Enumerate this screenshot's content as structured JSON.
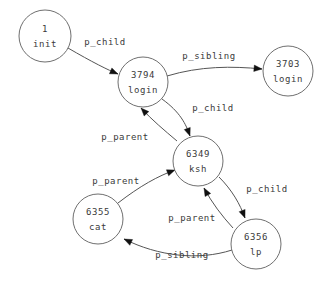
{
  "diagram": {
    "type": "directed-graph",
    "background_color": "#ffffff",
    "node_stroke_color": "#6f6f6f",
    "edge_stroke_color": "#555555",
    "text_color": "#3a3a3a",
    "nodes": [
      {
        "id": "init",
        "pid": "1",
        "name": "init",
        "cx": 45,
        "cy": 36,
        "r": 26
      },
      {
        "id": "login1",
        "pid": "3794",
        "name": "login",
        "cx": 143,
        "cy": 82,
        "r": 25
      },
      {
        "id": "login2",
        "pid": "3703",
        "name": "login",
        "cx": 288,
        "cy": 71,
        "r": 25
      },
      {
        "id": "ksh",
        "pid": "6349",
        "name": "ksh",
        "cx": 198,
        "cy": 161,
        "r": 25
      },
      {
        "id": "cat",
        "pid": "6355",
        "name": "cat",
        "cx": 98,
        "cy": 219,
        "r": 25
      },
      {
        "id": "lp",
        "pid": "6356",
        "name": "lp",
        "cx": 256,
        "cy": 244,
        "r": 25
      }
    ],
    "edges": [
      {
        "id": "e1",
        "from": "init",
        "to": "login1",
        "label": "p_child",
        "label_x": 105,
        "label_y": 42,
        "path": "M 68,48 C 92,62 108,70 118,74"
      },
      {
        "id": "e2",
        "from": "login1",
        "to": "login2",
        "label": "p_sibling",
        "label_x": 209,
        "label_y": 56,
        "path": "M 167,76 C 200,66 232,66 262,69"
      },
      {
        "id": "e3",
        "from": "login1",
        "to": "ksh",
        "label": "p_child",
        "label_x": 213,
        "label_y": 108,
        "path": "M 162,99 C 180,112 186,124 190,136"
      },
      {
        "id": "e4",
        "from": "ksh",
        "to": "login1",
        "label": "p_parent",
        "label_x": 125,
        "label_y": 137,
        "path": "M 177,141 C 164,130 152,120 141,108"
      },
      {
        "id": "e5",
        "from": "cat",
        "to": "ksh",
        "label": "p_parent",
        "label_x": 116,
        "label_y": 181,
        "path": "M 118,203 C 140,186 158,176 175,170"
      },
      {
        "id": "e6",
        "from": "ksh",
        "to": "lp",
        "label": "p_child",
        "label_x": 267,
        "label_y": 189,
        "path": "M 219,177 C 232,190 240,204 245,218"
      },
      {
        "id": "e7",
        "from": "lp",
        "to": "ksh",
        "label": "p_parent",
        "label_x": 192,
        "label_y": 218,
        "path": "M 233,228 C 222,216 212,203 204,188"
      },
      {
        "id": "e8",
        "from": "lp",
        "to": "cat",
        "label": "p_sibling",
        "label_x": 182,
        "label_y": 255,
        "path": "M 232,250 C 198,261 158,256 124,239"
      }
    ]
  }
}
